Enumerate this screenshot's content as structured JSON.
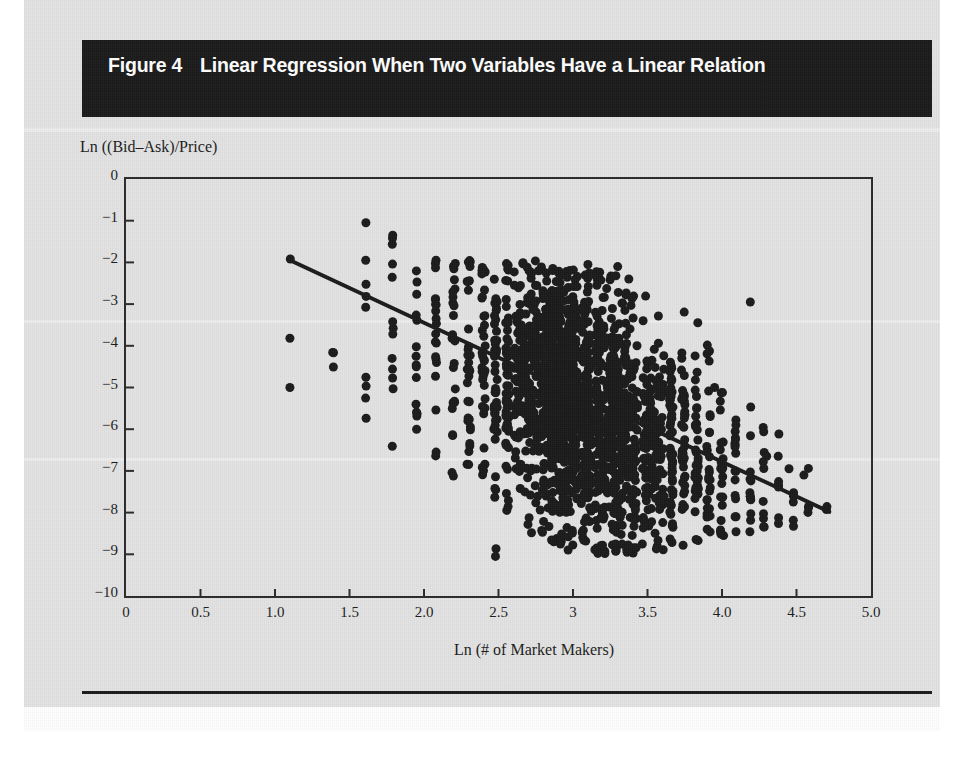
{
  "figure": {
    "label": "Figure 4",
    "title": "Linear Regression When Two Variables Have a Linear Relation"
  },
  "chart_data": {
    "type": "scatter",
    "title": "Linear Regression When Two Variables Have a Linear Relation",
    "xlabel": "Ln (# of Market Makers)",
    "ylabel": "Ln ((Bid–Ask)/Price)",
    "xlim": [
      0,
      5
    ],
    "ylim": [
      -10,
      0
    ],
    "grid": false,
    "legend": "none",
    "xticks": [
      0,
      0.5,
      1.0,
      1.5,
      2.0,
      2.5,
      3.0,
      3.5,
      4.0,
      4.5,
      5.0
    ],
    "xtick_labels": [
      "0",
      "0.5",
      "1.0",
      "1.5",
      "2.0",
      "2.5",
      "3",
      "3.5",
      "4.0",
      "4.5",
      "5.0"
    ],
    "yticks": [
      0,
      -1,
      -2,
      -3,
      -4,
      -5,
      -6,
      -7,
      -8,
      -9,
      -10
    ],
    "ytick_labels": [
      "0",
      "−1",
      "−2",
      "−3",
      "−4",
      "−5",
      "−6",
      "−7",
      "−8",
      "−9",
      "−10"
    ],
    "marker": {
      "shape": "circle",
      "color": "#1a1a1a",
      "size_px": 9
    },
    "regression_line": {
      "color": "#1a1a1a",
      "width_px": 4,
      "x_start": 1.09,
      "y_start": -1.93,
      "x_end": 4.72,
      "y_end": -7.98,
      "slope": -1.667,
      "intercept": -0.116
    },
    "series": [
      {
        "name": "Observations",
        "note": "Ln(# of market makers) takes discrete values because the underlying count is an integer; points form vertical strips.",
        "n_points_approx": 2400,
        "strips": [
          {
            "x": 1.1,
            "n": 1,
            "y_mean": -1.93,
            "y_sd": 0.1,
            "y_min": -1.95,
            "y_max": -1.9
          },
          {
            "x": 1.39,
            "n": 3,
            "y_mean": -4.3,
            "y_sd": 0.8,
            "y_min": -5.1,
            "y_max": -3.55
          },
          {
            "x": 1.61,
            "n": 8,
            "y_mean": -3.6,
            "y_sd": 1.7,
            "y_min": -6.4,
            "y_max": -1.05
          },
          {
            "x": 1.79,
            "n": 12,
            "y_mean": -3.7,
            "y_sd": 1.6,
            "y_min": -6.5,
            "y_max": -1.35
          },
          {
            "x": 1.95,
            "n": 14,
            "y_mean": -4.1,
            "y_sd": 1.6,
            "y_min": -6.6,
            "y_max": -1.95
          },
          {
            "x": 2.08,
            "n": 20,
            "y_mean": -4.1,
            "y_sd": 1.5,
            "y_min": -6.7,
            "y_max": -1.85
          },
          {
            "x": 2.2,
            "n": 24,
            "y_mean": -4.3,
            "y_sd": 1.55,
            "y_min": -7.2,
            "y_max": -2.0
          },
          {
            "x": 2.3,
            "n": 30,
            "y_mean": -4.35,
            "y_sd": 1.55,
            "y_min": -7.3,
            "y_max": -1.95
          },
          {
            "x": 2.4,
            "n": 36,
            "y_mean": -4.45,
            "y_sd": 1.6,
            "y_min": -7.6,
            "y_max": -2.05
          },
          {
            "x": 2.48,
            "n": 44,
            "y_mean": -4.55,
            "y_sd": 1.6,
            "y_min": -9.05,
            "y_max": -2.05
          },
          {
            "x": 2.56,
            "n": 54,
            "y_mean": -4.6,
            "y_sd": 1.55,
            "y_min": -8.1,
            "y_max": -1.95
          },
          {
            "x": 2.64,
            "n": 66,
            "y_mean": -4.7,
            "y_sd": 1.6,
            "y_min": -8.3,
            "y_max": -2.0
          },
          {
            "x": 2.71,
            "n": 80,
            "y_mean": -4.85,
            "y_sd": 1.65,
            "y_min": -8.5,
            "y_max": -2.05
          },
          {
            "x": 2.77,
            "n": 95,
            "y_mean": -4.95,
            "y_sd": 1.65,
            "y_min": -8.6,
            "y_max": -1.95
          },
          {
            "x": 2.83,
            "n": 110,
            "y_mean": -5.05,
            "y_sd": 1.65,
            "y_min": -8.7,
            "y_max": -2.05
          },
          {
            "x": 2.89,
            "n": 125,
            "y_mean": -5.15,
            "y_sd": 1.65,
            "y_min": -8.8,
            "y_max": -2.1
          },
          {
            "x": 2.94,
            "n": 140,
            "y_mean": -5.25,
            "y_sd": 1.6,
            "y_min": -8.8,
            "y_max": -2.1
          },
          {
            "x": 3.0,
            "n": 150,
            "y_mean": -5.35,
            "y_sd": 1.6,
            "y_min": -8.9,
            "y_max": -2.15
          },
          {
            "x": 3.09,
            "n": 150,
            "y_mean": -5.45,
            "y_sd": 1.55,
            "y_min": -8.9,
            "y_max": -2.2
          },
          {
            "x": 3.18,
            "n": 140,
            "y_mean": -5.6,
            "y_sd": 1.55,
            "y_min": -9.0,
            "y_max": -2.2
          },
          {
            "x": 3.26,
            "n": 125,
            "y_mean": -5.75,
            "y_sd": 1.5,
            "y_min": -9.0,
            "y_max": -2.25
          },
          {
            "x": 3.33,
            "n": 108,
            "y_mean": -5.9,
            "y_sd": 1.45,
            "y_min": -9.0,
            "y_max": -2.3
          },
          {
            "x": 3.4,
            "n": 92,
            "y_mean": -6.05,
            "y_sd": 1.4,
            "y_min": -9.0,
            "y_max": -2.35
          },
          {
            "x": 3.5,
            "n": 78,
            "y_mean": -6.2,
            "y_sd": 1.35,
            "y_min": -8.95,
            "y_max": -2.55
          },
          {
            "x": 3.58,
            "n": 64,
            "y_mean": -6.35,
            "y_sd": 1.3,
            "y_min": -8.9,
            "y_max": -2.6
          },
          {
            "x": 3.66,
            "n": 54,
            "y_mean": -6.45,
            "y_sd": 1.25,
            "y_min": -8.85,
            "y_max": -2.9
          },
          {
            "x": 3.74,
            "n": 44,
            "y_mean": -6.6,
            "y_sd": 1.2,
            "y_min": -8.8,
            "y_max": -3.05
          },
          {
            "x": 3.83,
            "n": 36,
            "y_mean": -6.7,
            "y_sd": 1.15,
            "y_min": -8.7,
            "y_max": -3.3
          },
          {
            "x": 3.91,
            "n": 28,
            "y_mean": -6.85,
            "y_sd": 1.1,
            "y_min": -8.6,
            "y_max": -3.45
          },
          {
            "x": 4.0,
            "n": 22,
            "y_mean": -7.0,
            "y_sd": 1.05,
            "y_min": -8.6,
            "y_max": -3.6
          },
          {
            "x": 4.09,
            "n": 17,
            "y_mean": -7.1,
            "y_sd": 1.0,
            "y_min": -8.55,
            "y_max": -4.4
          },
          {
            "x": 4.19,
            "n": 13,
            "y_mean": -7.2,
            "y_sd": 1.0,
            "y_min": -8.5,
            "y_max": -2.95
          },
          {
            "x": 4.28,
            "n": 10,
            "y_mean": -7.35,
            "y_sd": 0.95,
            "y_min": -8.45,
            "y_max": -5.1
          },
          {
            "x": 4.38,
            "n": 8,
            "y_mean": -7.45,
            "y_sd": 0.9,
            "y_min": -8.4,
            "y_max": -6.1
          },
          {
            "x": 4.48,
            "n": 6,
            "y_mean": -7.55,
            "y_sd": 0.85,
            "y_min": -8.35,
            "y_max": -6.5
          },
          {
            "x": 4.58,
            "n": 4,
            "y_mean": -7.6,
            "y_sd": 0.7,
            "y_min": -8.1,
            "y_max": -6.9
          },
          {
            "x": 4.7,
            "n": 2,
            "y_mean": -7.7,
            "y_sd": 0.5,
            "y_min": -8.0,
            "y_max": -7.4
          }
        ],
        "outliers": [
          {
            "x": 1.1,
            "y": -3.82
          },
          {
            "x": 1.1,
            "y": -5.0
          },
          {
            "x": 1.61,
            "y": -1.05
          },
          {
            "x": 1.79,
            "y": -1.35
          },
          {
            "x": 1.95,
            "y": -6.0
          },
          {
            "x": 2.3,
            "y": -6.85
          },
          {
            "x": 2.48,
            "y": -9.05
          },
          {
            "x": 4.19,
            "y": -2.95
          },
          {
            "x": 3.1,
            "y": -2.05
          },
          {
            "x": 3.3,
            "y": -2.1
          },
          {
            "x": 3.95,
            "y": -5.0
          },
          {
            "x": 4.3,
            "y": -6.65
          },
          {
            "x": 4.45,
            "y": -6.95
          },
          {
            "x": 4.55,
            "y": -7.1
          }
        ]
      }
    ]
  },
  "colors": {
    "title_bar": "#1a1a1a",
    "title_text": "#ffffff",
    "ink": "#1b1b1b",
    "paper": "#e3e3e3",
    "marker": "#1a1a1a"
  }
}
